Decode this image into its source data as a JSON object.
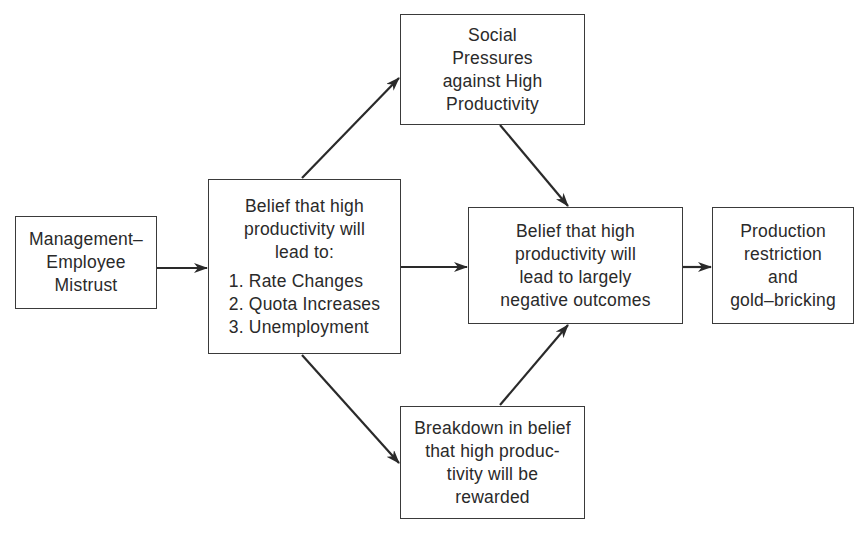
{
  "diagram": {
    "type": "flowchart",
    "nodes": [
      {
        "id": "mistrust",
        "lines": [
          "Management–",
          "Employee",
          "Mistrust"
        ]
      },
      {
        "id": "belief_lead_to",
        "lines": [
          "Belief that high",
          "productivity will",
          "lead to:"
        ],
        "list": [
          "1. Rate Changes",
          "2. Quota Increases",
          "3. Unemployment"
        ]
      },
      {
        "id": "social_pressures",
        "lines": [
          "Social",
          "Pressures",
          "against High",
          "Productivity"
        ]
      },
      {
        "id": "belief_negative",
        "lines": [
          "Belief that high",
          "productivity will",
          "lead to largely",
          "negative outcomes"
        ]
      },
      {
        "id": "production_restriction",
        "lines": [
          "Production",
          "restriction",
          "and",
          "gold–bricking"
        ]
      },
      {
        "id": "breakdown",
        "lines": [
          "Breakdown in belief",
          "that high produc-",
          "tivity will be",
          "rewarded"
        ]
      }
    ],
    "edges": [
      {
        "from": "mistrust",
        "to": "belief_lead_to"
      },
      {
        "from": "belief_lead_to",
        "to": "social_pressures"
      },
      {
        "from": "belief_lead_to",
        "to": "belief_negative"
      },
      {
        "from": "belief_lead_to",
        "to": "breakdown"
      },
      {
        "from": "social_pressures",
        "to": "belief_negative"
      },
      {
        "from": "breakdown",
        "to": "belief_negative"
      },
      {
        "from": "belief_negative",
        "to": "production_restriction"
      }
    ],
    "colors": {
      "line": "#2a2a2a",
      "border": "#3a3a3a",
      "background": "#ffffff"
    }
  }
}
